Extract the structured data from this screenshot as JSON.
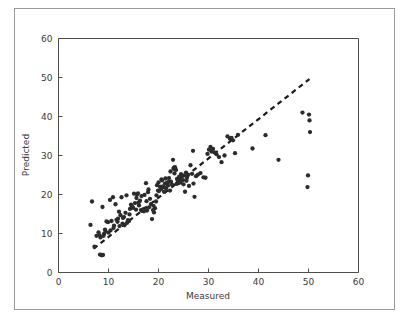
{
  "figure": {
    "background_color": "#ffffff",
    "frame_color": "#9a9a9a",
    "axis_color": "#4d4d4d",
    "marker_color": "#2b2b2b",
    "trend_color": "#1a1a1a"
  },
  "chart_data": {
    "type": "scatter",
    "title": "",
    "xlabel": "Measured",
    "ylabel": "Predicted",
    "xlim": [
      0,
      60
    ],
    "ylim": [
      0,
      60
    ],
    "xticks": [
      0,
      10,
      20,
      30,
      40,
      50,
      60
    ],
    "yticks": [
      0,
      10,
      20,
      30,
      40,
      50,
      60
    ],
    "xtick_labels": [
      "0",
      "10",
      "20",
      "30",
      "40",
      "50",
      "60"
    ],
    "ytick_labels": [
      "0",
      "10",
      "20",
      "30",
      "40",
      "50",
      "60"
    ],
    "grid": false,
    "legend": null,
    "marker_style": "filled-circle",
    "marker_size_px": 3.1,
    "series": [
      {
        "name": "predicted-vs-measured",
        "points": [
          [
            6.4,
            12.2
          ],
          [
            6.7,
            18.2
          ],
          [
            7.2,
            6.6
          ],
          [
            7.6,
            9.4
          ],
          [
            8.0,
            10.3
          ],
          [
            8.2,
            9.6
          ],
          [
            8.3,
            4.6
          ],
          [
            8.6,
            4.5
          ],
          [
            8.7,
            4.4
          ],
          [
            8.9,
            4.5
          ],
          [
            8.8,
            16.8
          ],
          [
            9.0,
            9.4
          ],
          [
            9.1,
            9.9
          ],
          [
            9.3,
            11.0
          ],
          [
            9.6,
            13.1
          ],
          [
            9.9,
            12.9
          ],
          [
            10.3,
            18.6
          ],
          [
            10.6,
            13.2
          ],
          [
            10.9,
            19.3
          ],
          [
            11.1,
            12.0
          ],
          [
            11.4,
            17.5
          ],
          [
            11.6,
            13.5
          ],
          [
            11.9,
            13.8
          ],
          [
            12.1,
            15.6
          ],
          [
            12.4,
            14.7
          ],
          [
            12.6,
            19.3
          ],
          [
            12.9,
            14.0
          ],
          [
            13.1,
            14.2
          ],
          [
            13.4,
            15.3
          ],
          [
            13.6,
            19.8
          ],
          [
            13.9,
            13.4
          ],
          [
            14.1,
            13.2
          ],
          [
            14.3,
            16.3
          ],
          [
            14.5,
            17.4
          ],
          [
            14.7,
            17.0
          ],
          [
            14.9,
            16.6
          ],
          [
            15.1,
            20.2
          ],
          [
            15.3,
            17.8
          ],
          [
            15.5,
            16.1
          ],
          [
            15.7,
            20.0
          ],
          [
            15.9,
            20.3
          ],
          [
            16.1,
            17.2
          ],
          [
            16.3,
            18.4
          ],
          [
            16.5,
            16.0
          ],
          [
            16.7,
            15.8
          ],
          [
            16.9,
            16.2
          ],
          [
            17.1,
            15.7
          ],
          [
            17.3,
            16.4
          ],
          [
            17.5,
            22.9
          ],
          [
            17.7,
            15.9
          ],
          [
            17.9,
            20.6
          ],
          [
            18.1,
            16.7
          ],
          [
            18.3,
            18.9
          ],
          [
            18.5,
            17.5
          ],
          [
            18.7,
            13.7
          ],
          [
            18.9,
            16.0
          ],
          [
            19.1,
            15.4
          ],
          [
            19.3,
            16.5
          ],
          [
            19.5,
            18.2
          ],
          [
            19.7,
            22.4
          ],
          [
            19.9,
            21.0
          ],
          [
            20.1,
            20.9
          ],
          [
            20.3,
            22.0
          ],
          [
            20.5,
            21.4
          ],
          [
            20.7,
            23.6
          ],
          [
            20.9,
            22.1
          ],
          [
            21.1,
            20.7
          ],
          [
            21.3,
            22.8
          ],
          [
            21.5,
            21.6
          ],
          [
            21.7,
            23.0
          ],
          [
            21.9,
            22.3
          ],
          [
            22.1,
            24.2
          ],
          [
            22.3,
            21.0
          ],
          [
            22.5,
            23.3
          ],
          [
            22.7,
            22.5
          ],
          [
            22.9,
            28.9
          ],
          [
            23.0,
            26.6
          ],
          [
            23.1,
            26.9
          ],
          [
            23.3,
            27.0
          ],
          [
            23.5,
            26.3
          ],
          [
            23.7,
            24.0
          ],
          [
            23.9,
            23.4
          ],
          [
            24.1,
            24.5
          ],
          [
            24.3,
            23.8
          ],
          [
            24.5,
            25.2
          ],
          [
            24.7,
            24.6
          ],
          [
            24.9,
            23.7
          ],
          [
            25.1,
            24.9
          ],
          [
            25.3,
            20.7
          ],
          [
            25.5,
            25.6
          ],
          [
            25.7,
            24.3
          ],
          [
            25.9,
            25.0
          ],
          [
            26.1,
            22.2
          ],
          [
            26.4,
            27.5
          ],
          [
            26.7,
            25.3
          ],
          [
            26.9,
            31.2
          ],
          [
            27.2,
            19.4
          ],
          [
            27.5,
            24.7
          ],
          [
            27.9,
            25.1
          ],
          [
            28.4,
            25.5
          ],
          [
            29.0,
            24.4
          ],
          [
            29.4,
            24.3
          ],
          [
            29.8,
            30.4
          ],
          [
            30.1,
            31.5
          ],
          [
            30.4,
            32.2
          ],
          [
            30.6,
            31.0
          ],
          [
            30.9,
            31.7
          ],
          [
            31.2,
            30.8
          ],
          [
            31.6,
            30.3
          ],
          [
            32.1,
            29.6
          ],
          [
            32.6,
            28.3
          ],
          [
            33.2,
            30.0
          ],
          [
            33.8,
            34.9
          ],
          [
            34.3,
            34.3
          ],
          [
            34.6,
            34.5
          ],
          [
            34.9,
            33.9
          ],
          [
            35.3,
            30.6
          ],
          [
            35.9,
            35.3
          ],
          [
            38.8,
            31.8
          ],
          [
            41.4,
            35.2
          ],
          [
            44.0,
            28.9
          ],
          [
            48.8,
            41.0
          ],
          [
            50.1,
            40.5
          ],
          [
            50.2,
            39.0
          ],
          [
            50.3,
            36.0
          ],
          [
            49.9,
            24.9
          ],
          [
            49.8,
            21.9
          ],
          [
            12.2,
            11.9
          ],
          [
            12.8,
            12.5
          ],
          [
            13.2,
            12.1
          ],
          [
            13.7,
            12.7
          ],
          [
            14.2,
            14.9
          ],
          [
            15.6,
            19.1
          ],
          [
            16.6,
            19.6
          ],
          [
            17.2,
            19.9
          ],
          [
            18.0,
            21.3
          ],
          [
            19.6,
            19.8
          ],
          [
            20.0,
            23.1
          ],
          [
            20.6,
            23.9
          ],
          [
            21.0,
            21.9
          ],
          [
            21.4,
            24.1
          ],
          [
            22.0,
            23.2
          ],
          [
            22.4,
            25.9
          ],
          [
            23.2,
            25.4
          ],
          [
            23.6,
            22.7
          ],
          [
            24.0,
            22.9
          ],
          [
            24.4,
            23.1
          ],
          [
            25.0,
            22.6
          ],
          [
            25.6,
            23.5
          ],
          [
            10.0,
            10.2
          ],
          [
            10.4,
            10.8
          ],
          [
            11.0,
            11.4
          ],
          [
            11.8,
            13.0
          ],
          [
            8.4,
            9.0
          ],
          [
            9.4,
            10.5
          ],
          [
            16.0,
            17.9
          ],
          [
            17.6,
            18.3
          ],
          [
            19.0,
            17.1
          ],
          [
            27.0,
            22.8
          ]
        ]
      }
    ],
    "trend_line": {
      "style": "dashed",
      "x_start": 7.0,
      "y_start": 6.1,
      "x_end": 50.2,
      "y_end": 49.6,
      "slope": 1.0,
      "intercept": -0.9
    }
  }
}
